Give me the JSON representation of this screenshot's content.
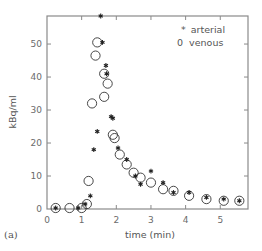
{
  "chart_data": {
    "type": "scatter",
    "title": "",
    "panel_label": "(a)",
    "xlabel": "time (min)",
    "ylabel": "kBq/ml",
    "xlim": [
      0,
      5.8
    ],
    "ylim": [
      0,
      58.5
    ],
    "xticks": [
      0,
      1,
      2,
      3,
      4,
      5
    ],
    "yticks": [
      0,
      10,
      20,
      30,
      40,
      50
    ],
    "grid": false,
    "legend": {
      "position": "upper right, inside",
      "entries": [
        {
          "marker": "*",
          "label": "arterial"
        },
        {
          "marker": "0",
          "label": "venous"
        }
      ]
    },
    "series": [
      {
        "name": "arterial",
        "marker": "asterisk",
        "points": [
          [
            0.25,
            0.3
          ],
          [
            0.9,
            0.3
          ],
          [
            1.1,
            1.5
          ],
          [
            1.25,
            4
          ],
          [
            1.35,
            18
          ],
          [
            1.45,
            23.5
          ],
          [
            1.55,
            58.5
          ],
          [
            1.6,
            50.5
          ],
          [
            1.7,
            43.5
          ],
          [
            1.72,
            41
          ],
          [
            1.85,
            28
          ],
          [
            1.9,
            27.5
          ],
          [
            2.05,
            18.5
          ],
          [
            2.3,
            15
          ],
          [
            2.55,
            10
          ],
          [
            2.7,
            7.5
          ],
          [
            3.0,
            11.5
          ],
          [
            3.35,
            8
          ],
          [
            3.65,
            5
          ],
          [
            4.1,
            5
          ],
          [
            4.6,
            3.5
          ],
          [
            5.1,
            3
          ],
          [
            5.55,
            2.5
          ]
        ]
      },
      {
        "name": "venous",
        "marker": "circle",
        "points": [
          [
            0.25,
            0.3
          ],
          [
            0.65,
            0.3
          ],
          [
            1.0,
            0.3
          ],
          [
            1.15,
            1.5
          ],
          [
            1.2,
            8.5
          ],
          [
            1.3,
            32
          ],
          [
            1.4,
            46.5
          ],
          [
            1.45,
            50.5
          ],
          [
            1.65,
            34
          ],
          [
            1.65,
            41
          ],
          [
            1.75,
            38
          ],
          [
            1.9,
            22.5
          ],
          [
            1.95,
            21.5
          ],
          [
            2.1,
            16.5
          ],
          [
            2.3,
            13.5
          ],
          [
            2.5,
            11
          ],
          [
            2.7,
            9.5
          ],
          [
            3.0,
            8
          ],
          [
            3.35,
            6
          ],
          [
            3.65,
            5.5
          ],
          [
            4.1,
            4
          ],
          [
            4.6,
            3
          ],
          [
            5.1,
            2.5
          ],
          [
            5.55,
            2.5
          ]
        ]
      }
    ]
  },
  "layout": {
    "plot_left": 47,
    "plot_right": 248,
    "plot_top": 16,
    "plot_bottom": 209,
    "axis_color": "#8a8a8a",
    "marker_color": "#333333"
  }
}
